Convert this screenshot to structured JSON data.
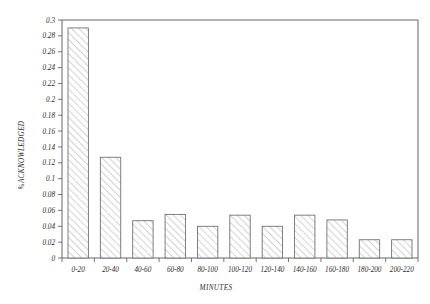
{
  "chart_data": {
    "type": "bar",
    "title": "",
    "subtitle": "",
    "xlabel": "MINUTES",
    "ylabel": "%ACKNOWLEDGED",
    "categories": [
      "0-20",
      "20-40",
      "40-60",
      "60-80",
      "80-100",
      "100-120",
      "120-140",
      "140-160",
      "160-180",
      "180-200",
      "200-220"
    ],
    "values": [
      0.29,
      0.127,
      0.047,
      0.055,
      0.04,
      0.054,
      0.04,
      0.054,
      0.048,
      0.023,
      0.023
    ],
    "ylim": [
      0,
      0.3
    ],
    "ytick_labels": [
      "0",
      "0.02",
      "0.04",
      "0.06",
      "0.08",
      "0.1",
      "0.12",
      "0.14",
      "0.16",
      "0.18",
      "0.2",
      "0.22",
      "0.24",
      "0.26",
      "0.28",
      "0.3"
    ],
    "ytick_values": [
      0,
      0.02,
      0.04,
      0.06,
      0.08,
      0.1,
      0.12,
      0.14,
      0.16,
      0.18,
      0.2,
      0.22,
      0.24,
      0.26,
      0.28,
      0.3
    ],
    "grid": false,
    "legend": null,
    "bar_fill": "hatched-diagonal",
    "bar_edge_color": "#6a6a6a",
    "axis_color": "#555555",
    "background_color": "#ffffff"
  }
}
